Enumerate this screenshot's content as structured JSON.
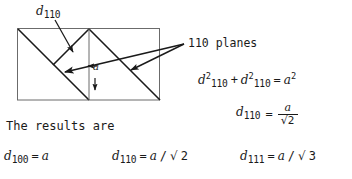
{
  "figure": {
    "type": "crystallographic-plane-diagram",
    "ink_color": "#1a1a1a",
    "background_color": "#ffffff",
    "callout_top": {
      "symbol": "d",
      "subscript": "110"
    },
    "lattice_constant_label": {
      "symbol": "a"
    },
    "planes_callout": {
      "text": "110 planes"
    }
  },
  "equations": {
    "pythagoras": {
      "term1_symbol": "d",
      "term1_sub": "110",
      "term1_sup": "2",
      "plus": "+",
      "term2_symbol": "d",
      "term2_sub": "110",
      "term2_sup": "2",
      "equals": "=",
      "rhs_symbol": "a",
      "rhs_sup": "2"
    },
    "solved_fraction": {
      "lhs_symbol": "d",
      "lhs_sub": "110",
      "equals": "=",
      "numerator": "a",
      "denominator_radical": "√",
      "denominator_value": "2"
    }
  },
  "results": {
    "intro": "The results are",
    "items": [
      {
        "symbol": "d",
        "sub": "100",
        "equals": "=",
        "value": "a"
      },
      {
        "symbol": "d",
        "sub": "110",
        "equals": "=",
        "value": "a",
        "slash": "/",
        "radical": "√",
        "radicand": "2"
      },
      {
        "symbol": "d",
        "sub": "111",
        "equals": "=",
        "value": "a",
        "slash": "/",
        "radical": "√",
        "radicand": "3"
      }
    ]
  }
}
